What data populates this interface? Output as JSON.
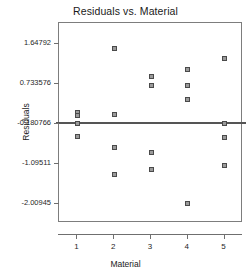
{
  "chart_data": {
    "type": "scatter",
    "title": "Residuals vs. Material",
    "xlabel": "Material",
    "ylabel": "Residuals",
    "grid": false,
    "legend": null,
    "xlim": [
      0.5,
      5.5
    ],
    "ylim": [
      -2.46,
      2.1
    ],
    "xticks": [
      1,
      2,
      3,
      4,
      5
    ],
    "xticklabels": [
      "1",
      "2",
      "3",
      "4",
      "5"
    ],
    "yticks": [
      1.64792,
      0.733576,
      -0.180766,
      -1.09511,
      -2.00945
    ],
    "yticklabels": [
      "1.64792",
      "0.733576",
      "-0.180766",
      "-1.09511",
      "-2.00945"
    ],
    "reference_line": {
      "y": -0.180766,
      "orientation": "horizontal",
      "color": "#555555"
    },
    "marker": {
      "shape": "square",
      "size": 5,
      "fill": "#9a9a9a",
      "edge": "#4a4a4a"
    },
    "points": [
      {
        "x": 1,
        "y": 0.07
      },
      {
        "x": 1,
        "y": 0.0
      },
      {
        "x": 1,
        "y": -0.18
      },
      {
        "x": 1,
        "y": -0.49
      },
      {
        "x": 2,
        "y": 1.53
      },
      {
        "x": 2,
        "y": 0.02
      },
      {
        "x": 2,
        "y": -0.74
      },
      {
        "x": 2,
        "y": -1.36
      },
      {
        "x": 3,
        "y": 0.87
      },
      {
        "x": 3,
        "y": 0.67
      },
      {
        "x": 3,
        "y": -0.85
      },
      {
        "x": 3,
        "y": -1.23
      },
      {
        "x": 4,
        "y": 1.03
      },
      {
        "x": 4,
        "y": 0.67
      },
      {
        "x": 4,
        "y": 0.36
      },
      {
        "x": 4,
        "y": -2.01
      },
      {
        "x": 5,
        "y": 1.29
      },
      {
        "x": 5,
        "y": -0.18
      },
      {
        "x": 5,
        "y": -0.52
      },
      {
        "x": 5,
        "y": -1.16
      }
    ],
    "series": [
      {
        "name": "Residuals",
        "x": [
          1,
          1,
          1,
          1,
          2,
          2,
          2,
          2,
          3,
          3,
          3,
          3,
          4,
          4,
          4,
          4,
          5,
          5,
          5,
          5
        ],
        "values": [
          0.07,
          0.0,
          -0.18,
          -0.49,
          1.53,
          0.02,
          -0.74,
          -1.36,
          0.87,
          0.67,
          -0.85,
          -1.23,
          1.03,
          0.67,
          0.36,
          -2.01,
          1.29,
          -0.18,
          -0.52,
          -1.16
        ]
      }
    ]
  }
}
